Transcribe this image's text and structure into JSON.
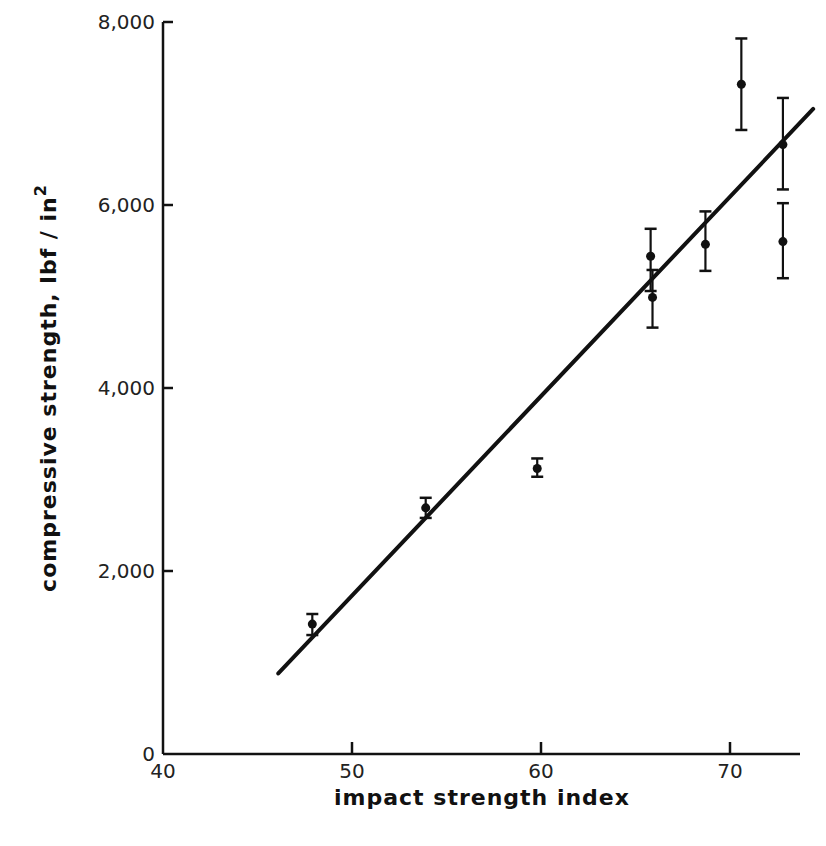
{
  "chart_data": {
    "type": "scatter",
    "title": "",
    "xlabel": "impact strength index",
    "ylabel": "compressive strength, lbf / in²",
    "ylabel_parts": {
      "main": "compressive   strength, lbf / in",
      "sup": "2"
    },
    "xlim": [
      40,
      74
    ],
    "ylim": [
      0,
      8000
    ],
    "x_ticks": [
      40,
      50,
      60,
      70
    ],
    "x_tick_labels": [
      "40",
      "50",
      "60",
      "70"
    ],
    "y_ticks": [
      0,
      2000,
      4000,
      6000,
      8000
    ],
    "y_tick_labels": [
      "0",
      "2,000",
      "4,000",
      "6,000",
      "8,000"
    ],
    "grid": false,
    "legend": null,
    "series": [
      {
        "name": "measurements",
        "points": [
          {
            "x": 47.9,
            "y": 1420,
            "err_low": 1300,
            "err_high": 1530
          },
          {
            "x": 53.9,
            "y": 2690,
            "err_low": 2580,
            "err_high": 2800
          },
          {
            "x": 59.8,
            "y": 3120,
            "err_low": 3030,
            "err_high": 3230
          },
          {
            "x": 65.8,
            "y": 5440,
            "err_low": 5060,
            "err_high": 5740
          },
          {
            "x": 65.9,
            "y": 4990,
            "err_low": 4660,
            "err_high": 5290
          },
          {
            "x": 68.7,
            "y": 5570,
            "err_low": 5280,
            "err_high": 5930
          },
          {
            "x": 70.6,
            "y": 7320,
            "err_low": 6820,
            "err_high": 7820
          },
          {
            "x": 72.8,
            "y": 6660,
            "err_low": 6170,
            "err_high": 7170
          },
          {
            "x": 72.8,
            "y": 5600,
            "err_low": 5200,
            "err_high": 6020
          }
        ]
      },
      {
        "name": "fit line",
        "type": "line",
        "x": [
          46.1,
          74.4
        ],
        "y": [
          880,
          7050
        ]
      }
    ]
  }
}
